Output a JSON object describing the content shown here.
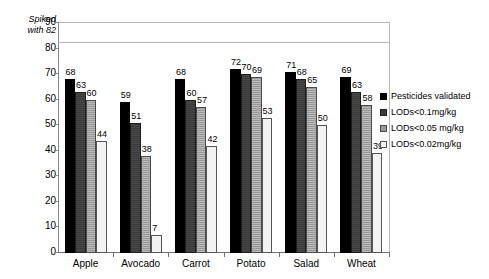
{
  "chart_data": {
    "type": "bar",
    "title": "",
    "subtitle": "",
    "xlabel": "",
    "ylabel": "",
    "ylim": [
      0,
      90
    ],
    "ytick_step": 10,
    "yticks": [
      0,
      10,
      20,
      30,
      40,
      50,
      60,
      70,
      80,
      90
    ],
    "grid": false,
    "legend_position": "right",
    "categories": [
      "Apple",
      "Avocado",
      "Carrot",
      "Potato",
      "Salad",
      "Wheat"
    ],
    "series": [
      {
        "name": "Pesticides validated",
        "values": [
          68,
          59,
          68,
          72,
          71,
          69
        ],
        "color": "#000000"
      },
      {
        "name": "LODs<0.1mg/kg",
        "values": [
          63,
          51,
          60,
          70,
          68,
          63
        ],
        "color": "#3a3a3a"
      },
      {
        "name": "LODs<0.05 mg/kg",
        "values": [
          60,
          38,
          57,
          69,
          65,
          58
        ],
        "color": "#9a9a9a"
      },
      {
        "name": "LODs<0.02mg/kg",
        "values": [
          44,
          7,
          42,
          53,
          50,
          39
        ],
        "color": "#f2f2f2"
      }
    ],
    "annotations": [
      {
        "name": "spiked-reference-line",
        "text_line1": "Spiked",
        "text_line2": "with 82",
        "value": 82,
        "style": "italic"
      }
    ]
  },
  "axis": {
    "y_labels": [
      "90",
      "80",
      "70",
      "60",
      "50",
      "40",
      "30",
      "20",
      "10",
      "0"
    ]
  },
  "annotation": {
    "spiked_line1": "Spiked",
    "spiked_line2": "with 82"
  },
  "legend": {
    "items": [
      {
        "label": "Pesticides validated"
      },
      {
        "label": "LODs<0.1mg/kg"
      },
      {
        "label": "LODs<0.05 mg/kg"
      },
      {
        "label": "LODs<0.02mg/kg"
      }
    ]
  }
}
